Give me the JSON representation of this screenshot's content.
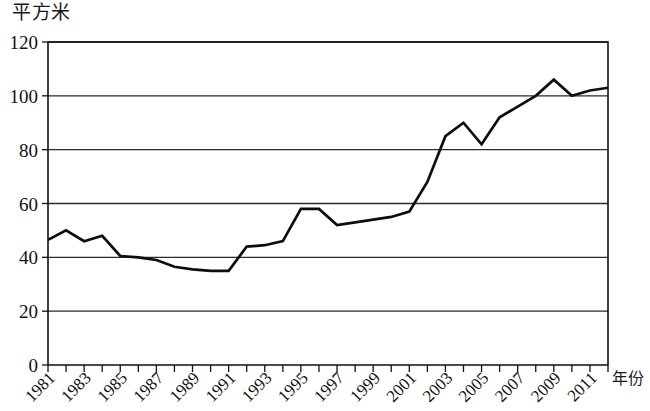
{
  "chart_data": {
    "type": "line",
    "title": "",
    "ylabel": "平方米",
    "xlabel": "年份",
    "ylim": [
      0,
      120
    ],
    "xlim": [
      1981,
      2012
    ],
    "grid": "horizontal",
    "legend": "none",
    "y_ticks": [
      0,
      20,
      40,
      60,
      80,
      100,
      120
    ],
    "y_tick_labels": [
      "0",
      "20",
      "40",
      "60",
      "80",
      "100",
      "120"
    ],
    "x_ticks": [
      1981,
      1982,
      1983,
      1984,
      1985,
      1986,
      1987,
      1988,
      1989,
      1990,
      1991,
      1992,
      1993,
      1994,
      1995,
      1996,
      1997,
      1998,
      1999,
      2000,
      2001,
      2002,
      2003,
      2004,
      2005,
      2006,
      2007,
      2008,
      2009,
      2010,
      2011,
      2012
    ],
    "x_tick_labels": [
      "1981",
      "",
      "1983",
      "",
      "1985",
      "",
      "1987",
      "",
      "1989",
      "",
      "1991",
      "",
      "1993",
      "",
      "1995",
      "",
      "1997",
      "",
      "1999",
      "",
      "2001",
      "",
      "2003",
      "",
      "2005",
      "",
      "2007",
      "",
      "2009",
      "",
      "2011",
      ""
    ],
    "series": [
      {
        "name": "人均住房面积",
        "x": [
          1981,
          1982,
          1983,
          1984,
          1985,
          1986,
          1987,
          1988,
          1989,
          1990,
          1991,
          1992,
          1993,
          1994,
          1995,
          1996,
          1997,
          1998,
          1999,
          2000,
          2001,
          2002,
          2003,
          2004,
          2005,
          2006,
          2007,
          2008,
          2009,
          2010,
          2011,
          2012
        ],
        "values": [
          46.5,
          50,
          46,
          48,
          40.5,
          40,
          39,
          36.5,
          35.5,
          35,
          35,
          44,
          44.5,
          46,
          58,
          58,
          52,
          53,
          54,
          55,
          57,
          68,
          85,
          90,
          82,
          92,
          96,
          100,
          106,
          100,
          102,
          103
        ]
      }
    ]
  }
}
